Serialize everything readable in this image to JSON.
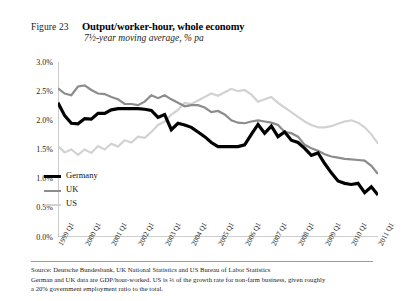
{
  "figure": {
    "label": "Figure 23",
    "title": "Output/worker-hour, whole economy",
    "subtitle": "7½-year moving average, % pa"
  },
  "footnotes": {
    "source": "Source: Deutsche Bundesbank, UK National Statistics and US Bureau of Labor Statistics",
    "note_line1": "German and UK data are GDP/hour-worked. US is ⅔ of the growth rate for non-farm business, given roughly",
    "note_line2": "a 20% government employment ratio to the total."
  },
  "legend": {
    "position": "inside-bottom-left",
    "items": [
      {
        "label": "Germany",
        "color": "#000000",
        "width": 3.2
      },
      {
        "label": "UK",
        "color": "#8c8c8c",
        "width": 2.2
      },
      {
        "label": "US",
        "color": "#d2d2d2",
        "width": 2.2
      }
    ]
  },
  "chart_data": {
    "type": "line",
    "title": "Output/worker-hour, whole economy",
    "subtitle": "7½-year moving average, % pa",
    "xlabel": "",
    "ylabel": "",
    "ylim": [
      0.0,
      3.0
    ],
    "ytick_step": 0.5,
    "ytick_labels": [
      "0.0%",
      "0.5%",
      "1.0%",
      "1.5%",
      "2.0%",
      "2.5%",
      "3.0%"
    ],
    "ytick_values": [
      0.0,
      0.5,
      1.0,
      1.5,
      2.0,
      2.5,
      3.0
    ],
    "grid": false,
    "x_axis_type": "quarterly",
    "xtick_labels": [
      "1999 Q1",
      "2000 Q1",
      "2001 Q1",
      "2002 Q1",
      "2003 Q1",
      "2004 Q1",
      "2005 Q1",
      "2006 Q1",
      "2007 Q1",
      "2008 Q1",
      "2009 Q1",
      "2010 Q1",
      "2011 Q1"
    ],
    "x": [
      "1999 Q1",
      "1999 Q2",
      "1999 Q3",
      "1999 Q4",
      "2000 Q1",
      "2000 Q2",
      "2000 Q3",
      "2000 Q4",
      "2001 Q1",
      "2001 Q2",
      "2001 Q3",
      "2001 Q4",
      "2002 Q1",
      "2002 Q2",
      "2002 Q3",
      "2002 Q4",
      "2003 Q1",
      "2003 Q2",
      "2003 Q3",
      "2003 Q4",
      "2004 Q1",
      "2004 Q2",
      "2004 Q3",
      "2004 Q4",
      "2005 Q1",
      "2005 Q2",
      "2005 Q3",
      "2005 Q4",
      "2006 Q1",
      "2006 Q2",
      "2006 Q3",
      "2006 Q4",
      "2007 Q1",
      "2007 Q2",
      "2007 Q3",
      "2007 Q4",
      "2008 Q1",
      "2008 Q2",
      "2008 Q3",
      "2008 Q4",
      "2009 Q1",
      "2009 Q2",
      "2009 Q3",
      "2009 Q4",
      "2010 Q1",
      "2010 Q2",
      "2010 Q3",
      "2010 Q4",
      "2011 Q1"
    ],
    "series": [
      {
        "name": "Germany",
        "color": "#000000",
        "width": 3.2,
        "values": [
          2.3,
          2.08,
          1.95,
          1.94,
          2.03,
          2.02,
          2.12,
          2.12,
          2.18,
          2.2,
          2.2,
          2.2,
          2.2,
          2.19,
          2.17,
          2.05,
          2.1,
          1.84,
          1.95,
          1.92,
          1.88,
          1.8,
          1.72,
          1.62,
          1.55,
          1.55,
          1.55,
          1.55,
          1.58,
          1.76,
          1.93,
          1.78,
          1.9,
          1.72,
          1.8,
          1.66,
          1.62,
          1.52,
          1.4,
          1.44,
          1.26,
          1.1,
          0.96,
          0.92,
          0.9,
          0.92,
          0.76,
          0.86,
          0.72
        ]
      },
      {
        "name": "UK",
        "color": "#8c8c8c",
        "width": 2.2,
        "values": [
          2.55,
          2.46,
          2.43,
          2.58,
          2.6,
          2.52,
          2.46,
          2.45,
          2.4,
          2.36,
          2.28,
          2.28,
          2.26,
          2.32,
          2.43,
          2.38,
          2.43,
          2.36,
          2.3,
          2.24,
          2.26,
          2.26,
          2.22,
          2.14,
          2.16,
          2.1,
          2.0,
          1.96,
          1.95,
          1.98,
          2.0,
          1.98,
          1.96,
          1.92,
          1.8,
          1.78,
          1.72,
          1.58,
          1.52,
          1.48,
          1.42,
          1.38,
          1.36,
          1.34,
          1.33,
          1.32,
          1.31,
          1.22,
          1.08
        ]
      },
      {
        "name": "US",
        "color": "#d2d2d2",
        "width": 2.2,
        "values": [
          1.56,
          1.45,
          1.5,
          1.41,
          1.5,
          1.44,
          1.56,
          1.5,
          1.6,
          1.55,
          1.66,
          1.62,
          1.72,
          1.7,
          1.8,
          1.92,
          1.98,
          2.1,
          2.18,
          2.3,
          2.28,
          2.34,
          2.4,
          2.46,
          2.42,
          2.48,
          2.54,
          2.5,
          2.52,
          2.44,
          2.32,
          2.36,
          2.4,
          2.3,
          2.22,
          2.14,
          2.06,
          1.98,
          1.92,
          1.88,
          1.88,
          1.9,
          1.94,
          1.98,
          2.0,
          1.96,
          1.88,
          1.76,
          1.6
        ]
      }
    ]
  }
}
